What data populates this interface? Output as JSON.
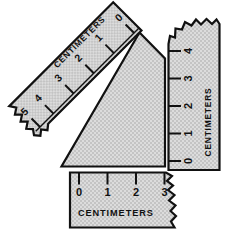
{
  "figure": {
    "background_color": "#ffffff",
    "paper_fill_color": "#d4d4d4",
    "ink_color": "#111111"
  },
  "rulers": [
    {
      "id": "diagonal-ruler",
      "orientation": "diagonal",
      "rotation_degrees": -45,
      "unit_label": "CENTIMETERS",
      "label_upside_down": true,
      "torn_edge": "lower-left-end",
      "ticks": [
        {
          "value": "0"
        },
        {
          "value": "1"
        },
        {
          "value": "2"
        },
        {
          "value": "3"
        },
        {
          "value": "4"
        },
        {
          "value": "5"
        }
      ]
    },
    {
      "id": "right-ruler",
      "orientation": "vertical",
      "rotation_degrees": -90,
      "unit_label": "CENTIMETERS",
      "label_upside_down": false,
      "torn_edge": "top-end",
      "ticks": [
        {
          "value": "0"
        },
        {
          "value": "1"
        },
        {
          "value": "2"
        },
        {
          "value": "3"
        },
        {
          "value": "4"
        }
      ]
    },
    {
      "id": "bottom-ruler",
      "orientation": "horizontal",
      "rotation_degrees": 0,
      "unit_label": "CENTIMETERS",
      "label_upside_down": false,
      "torn_edge": "right-end",
      "ticks": [
        {
          "value": "0"
        },
        {
          "value": "1"
        },
        {
          "value": "2"
        },
        {
          "value": "3"
        }
      ]
    }
  ],
  "shapes": [
    {
      "id": "center-pentagon",
      "description": "shaded quadrilateral wedge between the rulers"
    }
  ]
}
